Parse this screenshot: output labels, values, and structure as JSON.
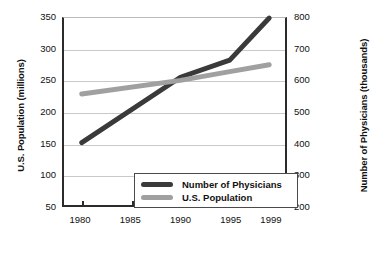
{
  "chart_data": {
    "type": "line",
    "title": "",
    "xlabel": "",
    "ylabel": "U.S. Population (millions)",
    "y2label": "Number of Physicians (thousands)",
    "grid": true,
    "legend_position": "bottom-center-inside",
    "x": [
      1980,
      1985,
      1990,
      1995,
      1999
    ],
    "categories": [
      "1980",
      "1985",
      "1990",
      "1995",
      "1999"
    ],
    "xlim": [
      1978.2,
      2000.6
    ],
    "ylim": [
      50,
      350
    ],
    "y2lim": [
      200,
      800
    ],
    "yticks": [
      "50",
      "100",
      "150",
      "200",
      "250",
      "300",
      "350"
    ],
    "ytick_values": [
      50,
      100,
      150,
      200,
      250,
      300,
      350
    ],
    "y2ticks": [
      "200",
      "300",
      "400",
      "500",
      "600",
      "700",
      "800"
    ],
    "y2tick_values": [
      200,
      300,
      400,
      500,
      600,
      700,
      800
    ],
    "series": [
      {
        "name": "Number of Physicians",
        "axis": "right",
        "unit": "thousands",
        "color": "#3a3a3a",
        "x": [
          1980,
          1990,
          1995,
          1999
        ],
        "values": [
          400,
          610,
          665,
          800
        ]
      },
      {
        "name": "U.S. Population",
        "axis": "left",
        "unit": "millions",
        "color": "#a0a0a0",
        "x": [
          1980,
          1990,
          1995,
          1999
        ],
        "values": [
          228,
          250,
          264,
          275
        ]
      }
    ]
  },
  "legend": {
    "items": [
      {
        "label": "Number of Physicians",
        "color": "#3a3a3a"
      },
      {
        "label": "U.S. Population",
        "color": "#a0a0a0"
      }
    ]
  }
}
